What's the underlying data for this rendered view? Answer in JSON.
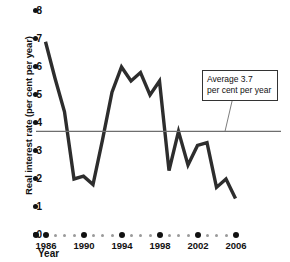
{
  "chart_data": {
    "type": "line",
    "title": "",
    "xlabel": "Year",
    "ylabel": "Real interest rate (per cent per year)",
    "xlim": [
      1985,
      2006
    ],
    "ylim": [
      0,
      8
    ],
    "ytick_labels": [
      "8",
      "7",
      "6",
      "5",
      "4",
      "3",
      "2",
      "1",
      "0"
    ],
    "ytick_values": [
      8,
      7,
      6,
      5,
      4,
      3,
      2,
      1,
      0
    ],
    "xtick_labels": [
      "1986",
      "1990",
      "1994",
      "1998",
      "2002",
      "2006"
    ],
    "xtick_values": [
      1986,
      1990,
      1994,
      1998,
      2002,
      2006
    ],
    "grid": false,
    "legend": "none",
    "x": [
      1986,
      1987,
      1988,
      1989,
      1990,
      1991,
      1992,
      1993,
      1994,
      1995,
      1996,
      1997,
      1998,
      1999,
      2000,
      2001,
      2002,
      2003,
      2004,
      2005,
      2006
    ],
    "values": [
      6.9,
      5.6,
      4.4,
      2.0,
      2.1,
      1.8,
      3.4,
      5.1,
      6.0,
      5.5,
      5.8,
      5.0,
      5.5,
      2.3,
      3.7,
      2.5,
      3.2,
      3.3,
      1.7,
      2.0,
      1.3
    ],
    "series": [
      {
        "name": "Real interest rate",
        "values": [
          6.9,
          5.6,
          4.4,
          2.0,
          2.1,
          1.8,
          3.4,
          5.1,
          6.0,
          5.5,
          5.8,
          5.0,
          5.5,
          2.3,
          3.7,
          2.5,
          3.2,
          3.3,
          1.7,
          2.0,
          1.3
        ]
      }
    ],
    "reference_line": {
      "value": 3.7,
      "label_line1": "Average 3.7",
      "label_line2": "per cent per year"
    },
    "colors": {
      "line": "#2d2d2d",
      "reference_line": "#6e6e6e",
      "axis": "#111111",
      "minor_tick": "#9a9a9a"
    }
  }
}
